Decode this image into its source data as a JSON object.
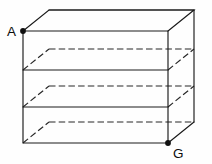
{
  "figure": {
    "name": "rectangular-shelf-unit",
    "canvas": {
      "width": 212,
      "height": 164
    },
    "style": {
      "background_color": "#fefefe",
      "solid_line_color": "#1a1a1a",
      "dashed_line_color": "#262626",
      "dot_color": "#101010",
      "label_color": "#0d0d0d",
      "line_width": 1.15,
      "dash_pattern": "6.5 3.2",
      "dot_radius": 2.9
    },
    "projection": {
      "type": "oblique-cabinet",
      "depth_dx": 26,
      "depth_dy": -21
    },
    "front_face": {
      "top_left": {
        "x": 23,
        "y": 31
      },
      "top_right": {
        "x": 168,
        "y": 31
      },
      "bottom_right": {
        "x": 168,
        "y": 143
      },
      "bottom_left": {
        "x": 23,
        "y": 143
      }
    },
    "back_face": {
      "top_left": {
        "x": 49,
        "y": 10
      },
      "top_right": {
        "x": 194,
        "y": 10
      },
      "bottom_right": {
        "x": 194,
        "y": 122
      },
      "bottom_left": {
        "x": 49,
        "y": 122
      }
    },
    "shelves": [
      {
        "id": "shelf-1",
        "front_y": 70,
        "back_y": 49,
        "front_solid": true,
        "back_dashed": true
      },
      {
        "id": "shelf-2",
        "front_y": 107,
        "back_y": 86,
        "front_solid": true,
        "back_dashed": true
      },
      {
        "id": "shelf-3",
        "front_y": 143,
        "back_y": 122,
        "front_solid": true,
        "back_dashed": true
      }
    ],
    "paths": {
      "front_rect": "M 23 31 L 168 31 L 168 143 L 23 143 Z",
      "top_face": "M 23 31 L 49 10 L 194 10 L 168 31",
      "back_top_edge": "M 49 10 L 194 10",
      "right_vertical_back": "M 194 10 L 194 122",
      "right_face_bottom": "M 168 143 L 194 122",
      "shelf1_front": "M 23 70 L 168 70",
      "shelf1_back_dashed": "M 49 49 L 194 49",
      "shelf1_left_oblique_dashed": "M 23 70 L 49 49",
      "shelf1_right_oblique_dashed": "M 168 70 L 194 49",
      "shelf2_front": "M 23 107 L 168 107",
      "shelf2_back_dashed": "M 49 86 L 194 86",
      "shelf2_left_oblique_dashed": "M 23 107 L 49 86",
      "shelf2_right_oblique_dashed": "M 168 107 L 194 86",
      "bottom_back_dashed": "M 49 122 L 194 122",
      "bottom_left_oblique_dashed": "M 23 143 L 49 122"
    },
    "vertices": [
      {
        "id": "vertex-a",
        "label": "A",
        "dot": {
          "x": 23,
          "y": 31,
          "r": 2.9
        },
        "label_pos": {
          "x": 7,
          "y": 36
        },
        "location": "front-top-left"
      },
      {
        "id": "vertex-g",
        "label": "G",
        "dot": {
          "x": 168,
          "y": 143,
          "r": 2.9
        },
        "label_pos": {
          "x": 173,
          "y": 158
        },
        "location": "front-bottom-right"
      }
    ]
  }
}
